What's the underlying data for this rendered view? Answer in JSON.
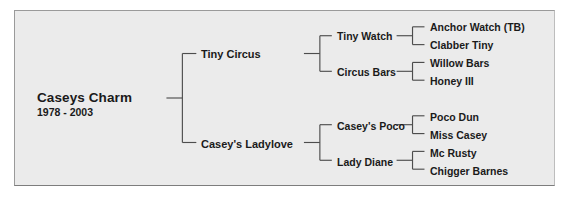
{
  "chart_type": "pedigree-tree",
  "colors": {
    "panel_background": "#ebebeb",
    "page_background": "#ffffff",
    "border": "#9a9a9a",
    "text": "#1a1a1a",
    "line": "#4d4d4d"
  },
  "subject": {
    "name": "Caseys Charm",
    "dates": "1978 - 2003"
  },
  "generation1": [
    {
      "label": "Tiny Circus"
    },
    {
      "label": "Casey's Ladylove"
    }
  ],
  "generation2": [
    {
      "label": "Tiny Watch"
    },
    {
      "label": "Circus Bars"
    },
    {
      "label": "Casey's Poco"
    },
    {
      "label": "Lady Diane"
    }
  ],
  "generation3": [
    {
      "label": "Anchor Watch (TB)"
    },
    {
      "label": "Clabber Tiny"
    },
    {
      "label": "Willow Bars"
    },
    {
      "label": "Honey III"
    },
    {
      "label": "Poco Dun"
    },
    {
      "label": "Miss Casey"
    },
    {
      "label": "Mc Rusty"
    },
    {
      "label": "Chigger Barnes"
    }
  ]
}
